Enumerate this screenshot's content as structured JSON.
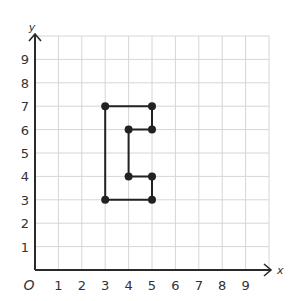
{
  "chart_data": {
    "type": "line",
    "title": "",
    "xlabel": "x",
    "ylabel": "y",
    "origin_label": "O",
    "xlim": [
      0,
      10
    ],
    "ylim": [
      0,
      10
    ],
    "x_ticks": [
      "1",
      "2",
      "3",
      "4",
      "5",
      "6",
      "7",
      "8",
      "9"
    ],
    "y_ticks": [
      "1",
      "2",
      "3",
      "4",
      "5",
      "6",
      "7",
      "8",
      "9"
    ],
    "grid": true,
    "series": [
      {
        "name": "shape",
        "closed": true,
        "points": [
          [
            3,
            7
          ],
          [
            5,
            7
          ],
          [
            5,
            6
          ],
          [
            4,
            6
          ],
          [
            4,
            4
          ],
          [
            5,
            4
          ],
          [
            5,
            3
          ],
          [
            3,
            3
          ]
        ]
      }
    ],
    "colors": {
      "grid": "#d6d6d6",
      "axis": "#2a2a2a",
      "shape": "#222222"
    }
  }
}
